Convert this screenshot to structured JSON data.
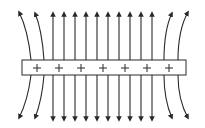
{
  "diagram": {
    "colors": {
      "line": "#2a2a2a",
      "background": "#ffffff",
      "plate_fill": "#ffffff"
    },
    "plate": {
      "x": 22,
      "y": 60,
      "width": 164,
      "height": 15,
      "charge_symbol": "+",
      "charge_count": 7,
      "charge_x": [
        37,
        59,
        81,
        103,
        125,
        147,
        169
      ],
      "charge_y": 68
    },
    "straight_lines_x": [
      53,
      64,
      75,
      86,
      97,
      108,
      119,
      130,
      141,
      152
    ],
    "line_top_y": 13,
    "line_bottom_y": 120,
    "curved_lines": {
      "top": [
        {
          "from": [
            31,
            60
          ],
          "ctrl": [
            28,
            30
          ],
          "to": [
            19,
            12
          ]
        },
        {
          "from": [
            44,
            60
          ],
          "ctrl": [
            42,
            30
          ],
          "to": [
            35,
            13
          ]
        },
        {
          "from": [
            164,
            60
          ],
          "ctrl": [
            164,
            30
          ],
          "to": [
            172,
            13
          ]
        },
        {
          "from": [
            178,
            60
          ],
          "ctrl": [
            178,
            30
          ],
          "to": [
            188,
            12
          ]
        }
      ],
      "bottom": [
        {
          "from": [
            31,
            75
          ],
          "ctrl": [
            28,
            100
          ],
          "to": [
            19,
            118
          ]
        },
        {
          "from": [
            44,
            75
          ],
          "ctrl": [
            42,
            100
          ],
          "to": [
            35,
            118
          ]
        },
        {
          "from": [
            164,
            75
          ],
          "ctrl": [
            164,
            100
          ],
          "to": [
            172,
            118
          ]
        },
        {
          "from": [
            178,
            75
          ],
          "ctrl": [
            178,
            100
          ],
          "to": [
            188,
            118
          ]
        }
      ]
    },
    "arrow_direction": "away from plate"
  }
}
